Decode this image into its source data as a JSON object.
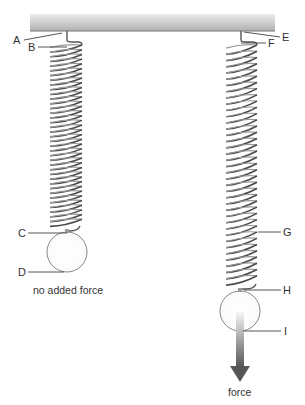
{
  "diagram": {
    "colors": {
      "ceiling_top": "#e6e6e6",
      "ceiling_bottom": "#b4b4b4",
      "spring": "#555555",
      "ball_stroke": "#888888",
      "leader": "#444444",
      "arrow_top": "#f4f4f4",
      "arrow_bottom": "#555555"
    },
    "labels": {
      "A": "A",
      "B": "B",
      "C": "C",
      "D": "D",
      "E": "E",
      "F": "F",
      "G": "G",
      "H": "H",
      "I": "I"
    },
    "captions": {
      "left": "no added force",
      "right": "force"
    },
    "springs": [
      {
        "name": "left-spring",
        "coil_count": 38,
        "state": "no added force"
      },
      {
        "name": "right-spring",
        "coil_count": 38,
        "state": "stretched by force"
      }
    ]
  }
}
